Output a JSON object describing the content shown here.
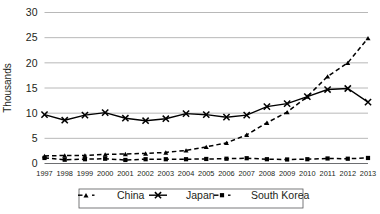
{
  "chart_data": {
    "type": "line",
    "title": "",
    "xlabel": "",
    "ylabel": "Thousands",
    "ylim": [
      0,
      30
    ],
    "yticks": [
      0,
      5,
      10,
      15,
      20,
      25,
      30
    ],
    "grid": true,
    "legend_position": "bottom",
    "categories": [
      "1997",
      "1998",
      "1999",
      "2000",
      "2001",
      "2002",
      "2003",
      "2004",
      "2005",
      "2006",
      "2007",
      "2008",
      "2009",
      "2010",
      "2011",
      "2012",
      "2013"
    ],
    "series": [
      {
        "name": "China",
        "marker": "triangle",
        "linestyle": "dashed",
        "color": "#000000",
        "values": [
          1.5,
          1.6,
          1.6,
          1.8,
          1.9,
          2.0,
          2.2,
          2.6,
          3.3,
          4.1,
          5.7,
          8.1,
          10.2,
          13.3,
          17.3,
          20.0,
          24.9
        ]
      },
      {
        "name": "Japan",
        "marker": "x",
        "linestyle": "solid",
        "color": "#000000",
        "values": [
          9.7,
          8.6,
          9.6,
          10.1,
          9.0,
          8.5,
          8.9,
          9.9,
          9.7,
          9.2,
          9.6,
          11.3,
          11.9,
          13.3,
          14.7,
          14.9,
          12.2
        ]
      },
      {
        "name": "South Korea",
        "marker": "square",
        "linestyle": "dashed",
        "color": "#000000",
        "values": [
          1.1,
          0.75,
          0.85,
          0.95,
          0.7,
          0.85,
          0.85,
          0.85,
          0.9,
          0.95,
          1.05,
          0.85,
          0.8,
          0.85,
          1.0,
          0.95,
          1.1
        ]
      }
    ]
  },
  "legend": {
    "items": [
      {
        "label": "China"
      },
      {
        "label": "Japan"
      },
      {
        "label": "South Korea"
      }
    ]
  }
}
